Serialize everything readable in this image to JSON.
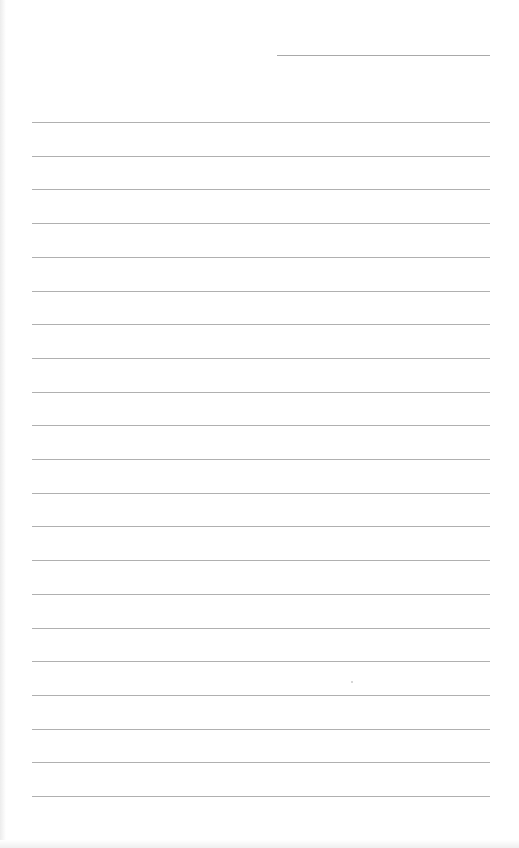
{
  "page": {
    "type": "lined-paper",
    "background": "#ffffff",
    "line_color": "#b0b0b0",
    "header_line": {
      "x": 277,
      "y": 55,
      "width": 213
    },
    "rules": {
      "count": 21,
      "start_y": 122,
      "spacing": 33.7,
      "x": 32,
      "width": 458
    },
    "text_content": []
  }
}
